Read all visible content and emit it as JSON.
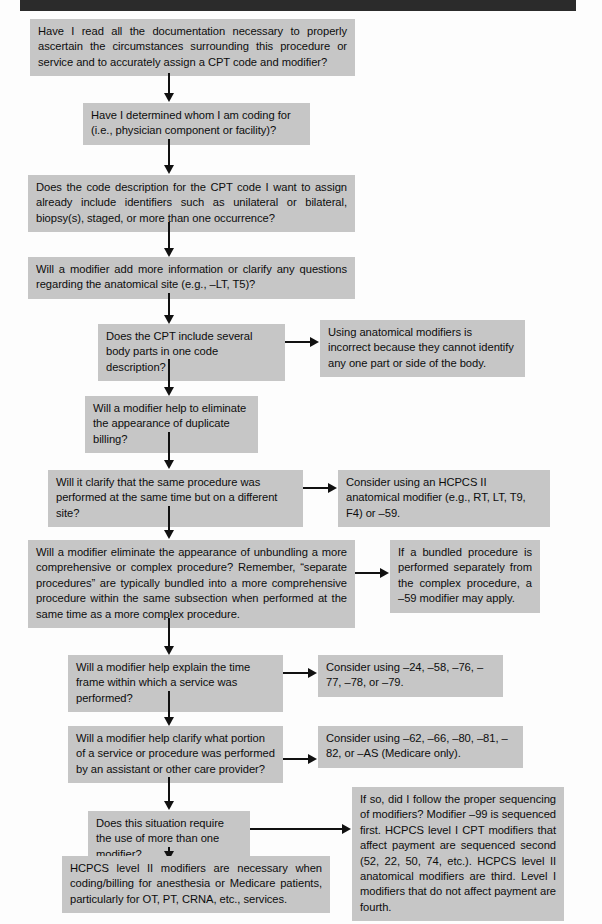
{
  "header_bar": {
    "name": "page-header-rule"
  },
  "nodes": [
    {
      "id": "q1",
      "text": "Have I read all the documentation necessary to properly ascertain the circumstances surrounding this procedure or service and to accurately assign a CPT code and modifier?"
    },
    {
      "id": "q2",
      "text": "Have I determined whom I am coding for (i.e., physician component or facility)?"
    },
    {
      "id": "q3",
      "text": "Does the code description for the CPT code I want to assign already include identifiers such as unilateral or bilateral, biopsy(s), staged, or more than one occurrence?"
    },
    {
      "id": "q4",
      "text": "Will a modifier add more information or clarify any questions regarding the anatomical site (e.g., –LT, T5)?"
    },
    {
      "id": "q5",
      "text": "Does the CPT include several body parts in one code description?"
    },
    {
      "id": "a5",
      "text": "Using anatomical modifiers is incorrect because they cannot identify any one part or side of the body."
    },
    {
      "id": "q6",
      "text": "Will a modifier help to eliminate the appearance of duplicate billing?"
    },
    {
      "id": "q7",
      "text": "Will it clarify that the same procedure was performed at the same time but on a different site?"
    },
    {
      "id": "a7",
      "text": "Consider using an HCPCS II anatomical modifier (e.g., RT, LT, T9, F4) or –59."
    },
    {
      "id": "q8",
      "text": "Will a modifier eliminate the appearance of unbundling a more comprehensive or complex procedure? Remember, “separate procedures” are typically bundled into a more comprehensive procedure within the same subsection when performed at the same time as a more complex procedure."
    },
    {
      "id": "a8",
      "text": "If a bundled procedure is performed separately from the complex procedure, a –59 modifier may apply."
    },
    {
      "id": "q9",
      "text": "Will a modifier help explain the time frame within which a service was performed?"
    },
    {
      "id": "a9",
      "text": "Consider using –24, –58, –76, –77, –78, or –79."
    },
    {
      "id": "q10",
      "text": "Will a modifier help clarify what portion of a service or procedure was performed by an assistant or other care provider?"
    },
    {
      "id": "a10",
      "text": "Consider using –62, –66, –80, –81, –82, or –AS (Medicare only)."
    },
    {
      "id": "q11",
      "text": "Does this situation require the use of more than one modifier?"
    },
    {
      "id": "a11",
      "text": "If so, did I follow the proper sequencing of modifiers?\nModifier –99 is sequenced first. HCPCS level I CPT modifiers that affect payment are sequenced second (52, 22, 50, 74, etc.). HCPCS level II anatomical modifiers are third. Level I modifiers that do not affect payment are fourth."
    },
    {
      "id": "q12",
      "text": "HCPCS level II modifiers are necessary when coding/billing for anesthesia or Medicare patients, particularly for OT, PT, CRNA, etc., services."
    }
  ],
  "a11_lines": [
    "If so, did I follow the proper sequencing",
    "of modifiers?",
    "Modifier –99 is sequenced first. HCPCS",
    "level I CPT modifiers that affect payment",
    "are sequenced second (52, 22, 50, 74,",
    "etc.). HCPCS level II anatomical modifiers",
    "are third. Level I modifiers that do not",
    "affect payment are fourth."
  ],
  "colors": {
    "box_fill": "#c6c6c6",
    "text": "#0d0d0d",
    "connector": "#111111",
    "header_bar": "#2b2b2b",
    "page_background": "#fdfdfd"
  },
  "connectors": [
    {
      "name": "q1-to-q2",
      "type": "vertical-arrow"
    },
    {
      "name": "q2-to-q3",
      "type": "vertical-arrow"
    },
    {
      "name": "q3-to-q4",
      "type": "vertical-arrow"
    },
    {
      "name": "q4-to-q5",
      "type": "vertical-arrow"
    },
    {
      "name": "q5-to-a5",
      "type": "horizontal-arrow"
    },
    {
      "name": "q5-to-q6",
      "type": "vertical-arrow"
    },
    {
      "name": "q6-to-q7",
      "type": "vertical-arrow"
    },
    {
      "name": "q7-to-a7",
      "type": "horizontal-arrow"
    },
    {
      "name": "q7-to-q8",
      "type": "vertical-arrow"
    },
    {
      "name": "q8-to-a8",
      "type": "horizontal-arrow"
    },
    {
      "name": "q8-to-q9",
      "type": "vertical-arrow"
    },
    {
      "name": "q9-to-a9",
      "type": "horizontal-arrow"
    },
    {
      "name": "q9-to-q10",
      "type": "vertical-arrow"
    },
    {
      "name": "q10-to-a10",
      "type": "horizontal-arrow"
    },
    {
      "name": "q10-to-q11",
      "type": "vertical-arrow"
    },
    {
      "name": "q11-to-a11",
      "type": "horizontal-arrow"
    },
    {
      "name": "q11-to-q12",
      "type": "vertical-arrow"
    }
  ]
}
